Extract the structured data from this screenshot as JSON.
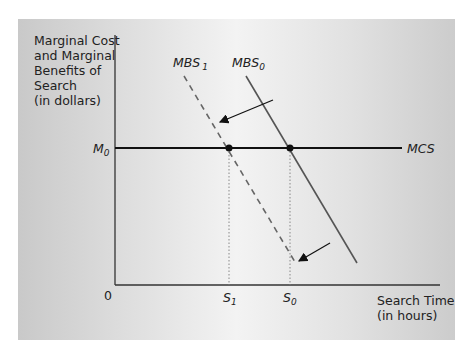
{
  "diagram": {
    "y_axis_label": [
      "Marginal Cost",
      "and Marginal",
      "Benefits of",
      "Search",
      "(in dollars)"
    ],
    "x_axis_label": [
      "Search Time",
      "(in hours)"
    ],
    "origin_label": "0",
    "y_tick": {
      "base": "M",
      "sub": "0"
    },
    "x_ticks": [
      {
        "base": "S",
        "sub": "1"
      },
      {
        "base": "S",
        "sub": "0"
      }
    ],
    "curves": {
      "mcs": {
        "label": "MCS",
        "style": "solid-horizontal"
      },
      "mbs0": {
        "base": "MBS",
        "sub": "0",
        "style": "solid"
      },
      "mbs1": {
        "base": "MBS",
        "sub": "1",
        "style": "dashed"
      }
    },
    "shift_direction": "MBS curve shifts left (from MBS0 to MBS1)",
    "colors": {
      "axis": "#333333",
      "mcs": "#111111",
      "mbs0": "#555555",
      "mbs1": "#666666",
      "dot": "#111111",
      "guide": "#888888"
    }
  }
}
